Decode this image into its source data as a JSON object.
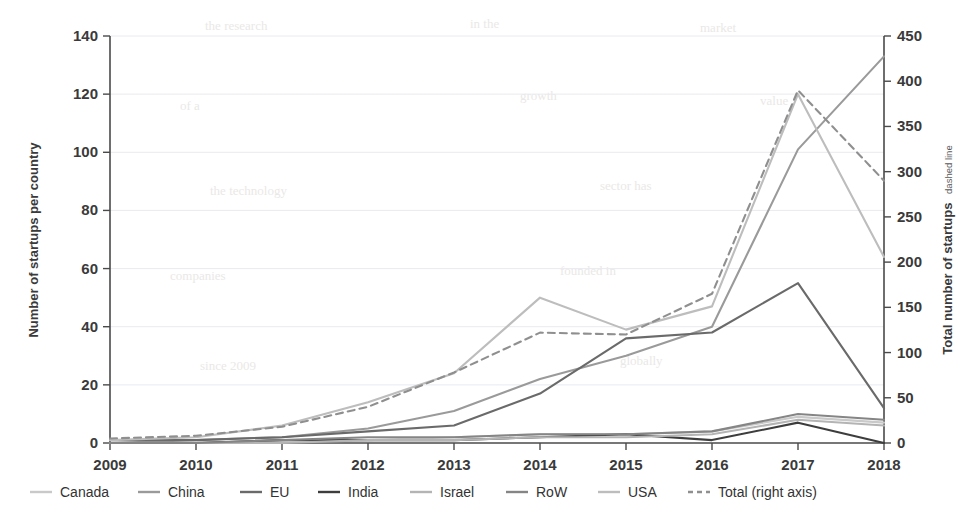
{
  "figure": {
    "background_color": "#ffffff",
    "plot": {
      "left_px": 110,
      "right_px": 884,
      "top_px": 36,
      "bottom_px": 443
    }
  },
  "left_axis": {
    "title": "Number of startups per country",
    "ticks": [
      0,
      20,
      40,
      60,
      80,
      100,
      120,
      140
    ],
    "min": 0,
    "max": 140
  },
  "right_axis": {
    "title_main": "Total number of startups",
    "title_sub": "dashed line",
    "ticks": [
      0,
      50,
      100,
      150,
      200,
      250,
      300,
      350,
      400,
      450
    ],
    "min": 0,
    "max": 450
  },
  "x_axis": {
    "ticks": [
      "2009",
      "2010",
      "2011",
      "2012",
      "2013",
      "2014",
      "2015",
      "2016",
      "2017",
      "2018"
    ]
  },
  "legend": {
    "items": [
      {
        "label": "Canada",
        "color": "#c9c9c9",
        "dash": "none",
        "swatch": "line-swatch"
      },
      {
        "label": "China",
        "color": "#9a9a9a",
        "dash": "none",
        "swatch": "line-swatch"
      },
      {
        "label": "EU",
        "color": "#6a6a6a",
        "dash": "none",
        "swatch": "line-swatch"
      },
      {
        "label": "India",
        "color": "#3d3d3d",
        "dash": "none",
        "swatch": "line-swatch"
      },
      {
        "label": "Israel",
        "color": "#b4b4b4",
        "dash": "none",
        "swatch": "line-swatch"
      },
      {
        "label": "RoW",
        "color": "#858585",
        "dash": "none",
        "swatch": "line-swatch"
      },
      {
        "label": "USA",
        "color": "#bdbdbd",
        "dash": "none",
        "swatch": "line-swatch"
      },
      {
        "label": "Total (right axis)",
        "color": "#8f8f8f",
        "dash": "7,5",
        "swatch": "dashed-swatch"
      }
    ]
  },
  "chart_data": {
    "type": "line",
    "title": "",
    "xlabel": "",
    "ylabel": "Number of startups per country",
    "y2label": "Total number of startups dashed line",
    "x": [
      2009,
      2010,
      2011,
      2012,
      2013,
      2014,
      2015,
      2016,
      2017,
      2018
    ],
    "xlim": [
      2009,
      2018
    ],
    "ylim": [
      0,
      140
    ],
    "y2lim": [
      0,
      450
    ],
    "grid": true,
    "legend_position": "bottom",
    "series": [
      {
        "name": "Canada",
        "axis": "left",
        "color": "#c9c9c9",
        "dash": "none",
        "values": [
          0,
          0,
          1,
          1,
          2,
          3,
          3,
          4,
          9,
          7
        ]
      },
      {
        "name": "China",
        "axis": "left",
        "color": "#9a9a9a",
        "dash": "none",
        "values": [
          0,
          1,
          2,
          5,
          11,
          22,
          30,
          40,
          101,
          133
        ]
      },
      {
        "name": "EU",
        "axis": "left",
        "color": "#6a6a6a",
        "dash": "none",
        "values": [
          1,
          1,
          2,
          4,
          6,
          17,
          36,
          38,
          55,
          12
        ]
      },
      {
        "name": "India",
        "axis": "left",
        "color": "#3d3d3d",
        "dash": "none",
        "values": [
          0,
          0,
          1,
          1,
          1,
          2,
          3,
          1,
          7,
          0
        ]
      },
      {
        "name": "Israel",
        "axis": "left",
        "color": "#b4b4b4",
        "dash": "none",
        "values": [
          0,
          0,
          0,
          1,
          1,
          2,
          2,
          3,
          8,
          6
        ]
      },
      {
        "name": "RoW",
        "axis": "left",
        "color": "#858585",
        "dash": "none",
        "values": [
          0,
          0,
          1,
          2,
          2,
          3,
          3,
          4,
          10,
          8
        ]
      },
      {
        "name": "USA",
        "axis": "left",
        "color": "#bdbdbd",
        "dash": "none",
        "values": [
          1,
          2,
          6,
          14,
          24,
          50,
          39,
          47,
          120,
          64
        ]
      },
      {
        "name": "Total (right axis)",
        "axis": "right",
        "color": "#8f8f8f",
        "dash": "7,5",
        "values": [
          5,
          8,
          18,
          40,
          78,
          122,
          120,
          165,
          390,
          290
        ]
      }
    ]
  }
}
